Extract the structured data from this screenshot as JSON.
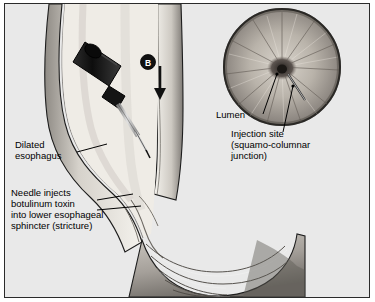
{
  "figure": {
    "title": "",
    "background_color": "#e9e9e9",
    "border_color": "#2b2b2b"
  },
  "labels": {
    "dilated_esophagus": "Dilated\nesophagus",
    "needle_injects": "Needle injects\nbotulinum toxin\ninto lower esophageal\nsphincter (stricture)",
    "lumen": "Lumen",
    "injection_site": "Injection site\n(squamo-columnar\njunction)"
  },
  "markers": {
    "arrow_badge": "B"
  },
  "colors": {
    "tissue_light": "#f2efe9",
    "tissue_mid": "#c9c5bd",
    "tissue_dark": "#8d8a84",
    "shadow": "#6e6b66",
    "lumen_dark": "#2a2724",
    "instrument_dark": "#1a1a1a",
    "needle_gray": "#b9b9b9",
    "outline": "#000000"
  }
}
